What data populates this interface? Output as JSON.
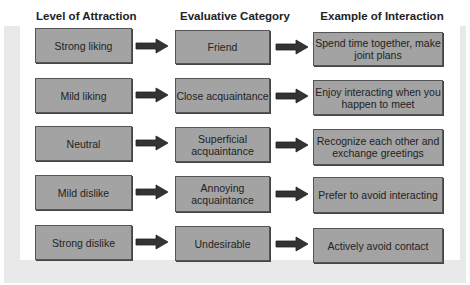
{
  "headers": {
    "level": "Level of Attraction",
    "category": "Evaluative Category",
    "example": "Example of Interaction"
  },
  "rows": [
    {
      "level": "Strong liking",
      "category": "Friend",
      "example": "Spend time together, make joint plans"
    },
    {
      "level": "Mild liking",
      "category": "Close acquaintance",
      "example": "Enjoy interacting when you happen to meet"
    },
    {
      "level": "Neutral",
      "category": "Superficial acquaintance",
      "example": "Recognize each other and exchange greetings"
    },
    {
      "level": "Mild dislike",
      "category": "Annoying acquaintance",
      "example": "Prefer to avoid interacting"
    },
    {
      "level": "Strong dislike",
      "category": "Undesirable",
      "example": "Actively avoid contact"
    }
  ],
  "colors": {
    "box_fill": "#a3a3a3",
    "arrow": "#333333",
    "frame": "#e9e9e9"
  }
}
